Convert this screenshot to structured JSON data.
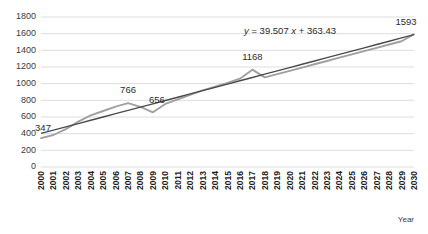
{
  "chart_data": {
    "type": "line",
    "title": "",
    "xlabel": "Year",
    "ylabel": "",
    "ylim": [
      0,
      1800
    ],
    "ytick_step": 200,
    "grid": true,
    "legend": false,
    "ytick_labels": [
      "0",
      "200",
      "400",
      "600",
      "800",
      "1000",
      "1200",
      "1400",
      "1600",
      "1800"
    ],
    "ytick_values": [
      0,
      200,
      400,
      600,
      800,
      1000,
      1200,
      1400,
      1600,
      1800
    ],
    "categories": [
      "2000",
      "2001",
      "2002",
      "2003",
      "2004",
      "2005",
      "2006",
      "2007",
      "2008",
      "2009",
      "2010",
      "2011",
      "2012",
      "2013",
      "2014",
      "2015",
      "2016",
      "2017",
      "2018",
      "2019",
      "2020",
      "2021",
      "2022",
      "2023",
      "2024",
      "2025",
      "2026",
      "2027",
      "2028",
      "2029",
      "2030"
    ],
    "series": [
      {
        "name": "data",
        "color": "#a0a0a0",
        "values": [
          347,
          384,
          455,
          545,
          620,
          672,
          724,
          766,
          722,
          656,
          757,
          811,
          866,
          920,
          963,
          1010,
          1060,
          1168,
          1075,
          1114,
          1154,
          1193,
          1233,
          1272,
          1312,
          1351,
          1391,
          1430,
          1470,
          1509,
          1593
        ]
      },
      {
        "name": "trendline",
        "color": "#4a4a4a",
        "values": [
          403,
          442,
          482,
          521,
          561,
          600,
          640,
          679,
          719,
          758,
          798,
          837,
          877,
          916,
          956,
          995,
          1035,
          1074,
          1114,
          1153,
          1193,
          1233,
          1272,
          1312,
          1351,
          1391,
          1430,
          1470,
          1509,
          1549,
          1588
        ]
      }
    ],
    "annotations": [
      {
        "name": "trendline-equation",
        "text_plain": "y = 39.507x + 363.43",
        "y_var": "y",
        "equals": "= 39.507",
        "x_var": "x",
        "intercept": "+ 363.43"
      }
    ],
    "point_labels": [
      {
        "name": "label-2000",
        "category": "2000",
        "value": 347,
        "text": "347"
      },
      {
        "name": "label-2007",
        "category": "2007",
        "value": 766,
        "text": "766"
      },
      {
        "name": "label-2009",
        "category": "2009",
        "value": 656,
        "text": "656"
      },
      {
        "name": "label-2017",
        "category": "2017",
        "value": 1168,
        "text": "1168"
      },
      {
        "name": "label-2030",
        "category": "2030",
        "value": 1593,
        "text": "1593"
      }
    ]
  }
}
